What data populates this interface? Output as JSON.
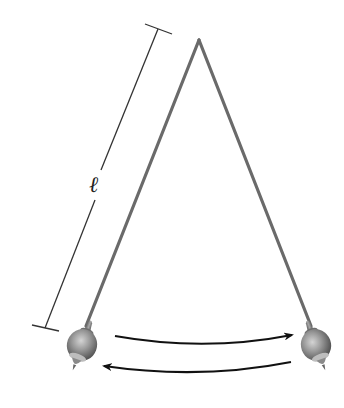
{
  "diagram": {
    "length_label": "ℓ",
    "colors": {
      "background": "#ffffff",
      "string": "#6a6a6a",
      "dimension_line": "#333333",
      "arrow": "#111111",
      "bob_dark": "#5a5a5a",
      "bob_light": "#c8c8c8"
    },
    "pivot": {
      "x": 199,
      "y": 40
    },
    "left_bob": {
      "x": 82,
      "y": 345
    },
    "right_bob": {
      "x": 316,
      "y": 345
    },
    "arrows": [
      {
        "direction": "left-to-right",
        "from": [
          115,
          337
        ],
        "to": [
          292,
          337
        ]
      },
      {
        "direction": "right-to-left",
        "from": [
          292,
          362
        ],
        "to": [
          104,
          367
        ]
      }
    ]
  }
}
